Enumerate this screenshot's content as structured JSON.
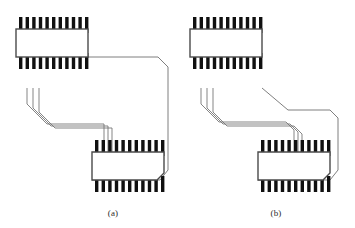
{
  "figure": {
    "width": 355,
    "height": 228,
    "background_color": "#ffffff"
  },
  "style": {
    "pin_color": "#101010",
    "chip_outline_color": "#4a4a4a",
    "chip_fill_color": "#ffffff",
    "trace_color": "#6f6f6f",
    "caption_color": "#2b2b2b"
  },
  "panels": [
    {
      "id": "panel-a",
      "caption": "(a)",
      "caption_x": 113,
      "caption_y": 216,
      "description": "Long detour routing: trace bundle exits the upper chip, runs far right and wraps around to reach the lower chip",
      "chips": [
        {
          "id": "chip-a-top",
          "role": "upper-ic-package",
          "x": 16,
          "y": 29,
          "width": 72,
          "height": 28,
          "top_pins": 11,
          "bottom_pins": 11,
          "pin_width": 3.4,
          "pin_height": 16,
          "pin_pitch": 6.6,
          "pin_start_x": 19,
          "notch_corner": "none"
        },
        {
          "id": "chip-a-bottom",
          "role": "lower-ic-package",
          "x": 92,
          "y": 152,
          "width": 72,
          "height": 28,
          "top_pins": 11,
          "bottom_pins": 11,
          "pin_width": 3.4,
          "pin_height": 16,
          "pin_pitch": 6.6,
          "pin_start_x": 95,
          "notch_corner": "bottom-right"
        }
      ],
      "routing": {
        "style": "long-detour",
        "trace_count": 3,
        "board_outline": [
          [
            88,
            57
          ],
          [
            158,
            57
          ],
          [
            168,
            67
          ],
          [
            168,
            170
          ],
          [
            160,
            180
          ],
          [
            92,
            180
          ]
        ],
        "traces": [
          [
            [
              27,
              88
            ],
            [
              27,
              104
            ],
            [
              47,
              124
            ],
            [
              104,
              124
            ],
            [
              104,
              152
            ]
          ],
          [
            [
              33,
              88
            ],
            [
              33,
              108
            ],
            [
              51,
              126
            ],
            [
              108,
              126
            ],
            [
              108,
              152
            ]
          ],
          [
            [
              39,
              88
            ],
            [
              39,
              112
            ],
            [
              55,
              128
            ],
            [
              112,
              128
            ],
            [
              112,
              152
            ]
          ]
        ]
      }
    },
    {
      "id": "panel-b",
      "caption": "(b)",
      "caption_x": 276,
      "caption_y": 216,
      "description": "Compact routing: trace bundle runs a short diagonal directly into the lower chip",
      "chips": [
        {
          "id": "chip-b-top",
          "role": "upper-ic-package",
          "x": 190,
          "y": 29,
          "width": 72,
          "height": 28,
          "top_pins": 11,
          "bottom_pins": 11,
          "pin_width": 3.4,
          "pin_height": 16,
          "pin_pitch": 6.6,
          "pin_start_x": 193,
          "notch_corner": "none"
        },
        {
          "id": "chip-b-bottom",
          "role": "lower-ic-package",
          "x": 258,
          "y": 152,
          "width": 72,
          "height": 28,
          "top_pins": 11,
          "bottom_pins": 11,
          "pin_width": 3.4,
          "pin_height": 16,
          "pin_pitch": 6.6,
          "pin_start_x": 261,
          "notch_corner": "bottom-right"
        }
      ],
      "routing": {
        "style": "compact-direct",
        "trace_count": 3,
        "board_outline": [
          [
            262,
            88
          ],
          [
            288,
            110
          ],
          [
            330,
            110
          ],
          [
            338,
            118
          ],
          [
            338,
            170
          ],
          [
            330,
            180
          ],
          [
            258,
            180
          ]
        ],
        "traces": [
          [
            [
              201,
              88
            ],
            [
              201,
              104
            ],
            [
              219,
              122
            ],
            [
              286,
              122
            ],
            [
              294,
              130
            ],
            [
              294,
              152
            ]
          ],
          [
            [
              207,
              88
            ],
            [
              207,
              108
            ],
            [
              223,
              124
            ],
            [
              290,
              124
            ],
            [
              298,
              132
            ],
            [
              298,
              152
            ]
          ],
          [
            [
              213,
              88
            ],
            [
              213,
              112
            ],
            [
              227,
              126
            ],
            [
              294,
              126
            ],
            [
              302,
              134
            ],
            [
              302,
              152
            ]
          ]
        ]
      }
    }
  ]
}
